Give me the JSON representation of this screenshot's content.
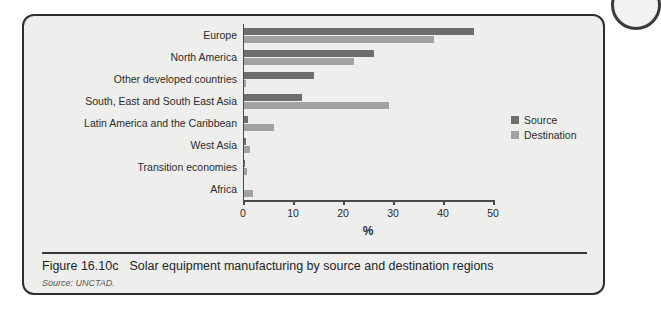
{
  "figure": {
    "number_label": "Figure 16.10c",
    "title": "Solar equipment manufacturing by source and destination regions",
    "source_note": "Source: UNCTAD."
  },
  "legend": {
    "position": "right",
    "items": [
      {
        "label": "Source",
        "color": "#6e6e6e",
        "swatch_name": "legend-swatch-source"
      },
      {
        "label": "Destination",
        "color": "#a2a2a2",
        "swatch_name": "legend-swatch-destination"
      }
    ]
  },
  "colors": {
    "source": "#6e6e6e",
    "destination": "#a2a2a2",
    "panel_background": "#eeeeec",
    "panel_border": "#2e2e2e",
    "axis": "#4a4a4a",
    "text": "#2b2b2b"
  },
  "chart_data": {
    "type": "bar",
    "orientation": "horizontal",
    "title": "Solar equipment manufacturing by source and destination regions",
    "xlabel": "%",
    "ylabel": "",
    "xlim": [
      0,
      50
    ],
    "xticks": [
      0,
      10,
      20,
      30,
      40,
      50
    ],
    "xtick_labels": [
      "0",
      "10",
      "20",
      "30",
      "40",
      "50"
    ],
    "grid": false,
    "legend_position": "right",
    "categories": [
      "Europe",
      "North America",
      "Other developed countries",
      "South, East and South East Asia",
      "Latin America and the Caribbean",
      "West Asia",
      "Transition economies",
      "Africa"
    ],
    "series": [
      {
        "name": "Source",
        "color": "#6e6e6e",
        "values": [
          46,
          26,
          14,
          11.5,
          0.7,
          0.4,
          0.2,
          0
        ]
      },
      {
        "name": "Destination",
        "color": "#a2a2a2",
        "values": [
          38,
          22,
          0.3,
          29,
          6,
          1.2,
          0.6,
          1.8
        ]
      }
    ]
  }
}
